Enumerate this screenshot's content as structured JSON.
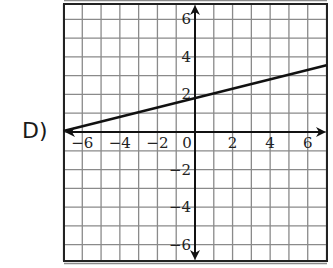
{
  "option_label": "D)",
  "chart_data": {
    "type": "line",
    "title": "",
    "xlabel": "",
    "ylabel": "",
    "xlim": [
      -7,
      7
    ],
    "ylim": [
      -7,
      7
    ],
    "grid": true,
    "x_ticks": [
      "-6",
      "-4",
      "-2",
      "0",
      "2",
      "4",
      "6"
    ],
    "y_ticks": [
      "6",
      "4",
      "2",
      "-2",
      "-4",
      "-6"
    ],
    "series": [
      {
        "name": "line",
        "slope": 0.25,
        "intercept": 1.8,
        "x": [
          -7,
          7
        ],
        "values": [
          0.05,
          3.55
        ]
      }
    ]
  },
  "colors": {
    "grid": "#8a8a8a",
    "axis": "#111111",
    "line": "#111111",
    "frame": "#222222"
  }
}
